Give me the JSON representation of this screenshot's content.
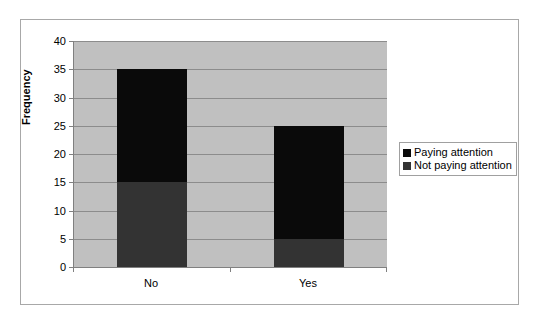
{
  "chart_data": {
    "type": "bar",
    "subtype": "stacked-column",
    "title": "",
    "xlabel": "",
    "ylabel": "Frequency",
    "categories": [
      "No",
      "Yes"
    ],
    "series": [
      {
        "name": "Not paying attention",
        "values": [
          15,
          5
        ],
        "color": "#333333"
      },
      {
        "name": "Paying attention",
        "values": [
          20,
          20
        ],
        "color": "#0a0a0a"
      }
    ],
    "stack_totals": [
      35,
      25
    ],
    "ylim": [
      0,
      40
    ],
    "ytick_values": [
      0,
      5,
      10,
      15,
      20,
      25,
      30,
      35,
      40
    ],
    "ytick_labels": [
      "0",
      "5",
      "10",
      "15",
      "20",
      "25",
      "30",
      "35",
      "40"
    ],
    "grid": true,
    "legend_position": "right",
    "plot_background": "#c0c0c0",
    "gridline_color": "#8c8c8c",
    "axis_color": "#808080"
  },
  "legend": {
    "items": [
      {
        "label": "Paying attention",
        "color": "#0a0a0a"
      },
      {
        "label": "Not paying attention",
        "color": "#333333"
      }
    ]
  }
}
